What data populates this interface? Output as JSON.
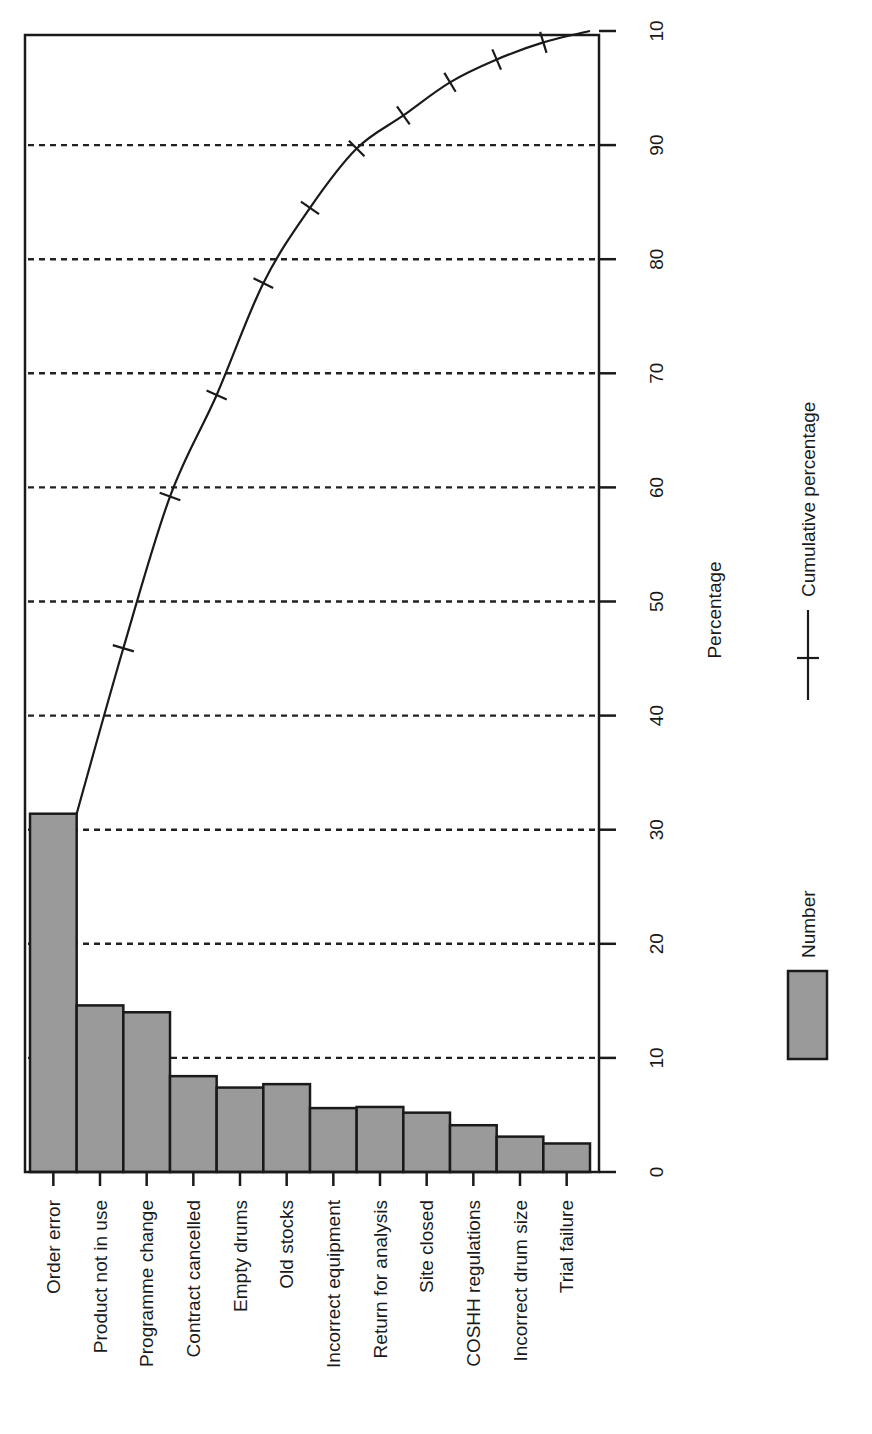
{
  "chart_data": {
    "type": "bar",
    "title": "",
    "orientation": "rotated-90-clockwise",
    "xlabel": "",
    "ylabel": "Percentage",
    "ylim": [
      0,
      100
    ],
    "yticks": [
      0,
      10,
      20,
      30,
      40,
      50,
      60,
      70,
      80,
      90,
      100
    ],
    "ytick_labels": [
      "0",
      "10",
      "20",
      "30",
      "40",
      "50",
      "60",
      "70",
      "80",
      "90",
      "10"
    ],
    "grid": "dashed horizontal lines at 10-unit intervals",
    "categories": [
      "Order error",
      "Product not in use",
      "Programme change",
      "Contract cancelled",
      "Empty drums",
      "Old stocks",
      "Incorrect equipment",
      "Return for analysis",
      "Site closed",
      "COSHH regulations",
      "Incorrect drum size",
      "Trial failure"
    ],
    "series": [
      {
        "name": "Number",
        "type": "bar",
        "values": [
          31.4,
          14.6,
          14.0,
          8.4,
          7.4,
          7.7,
          5.6,
          5.7,
          5.2,
          4.1,
          3.1,
          2.5
        ]
      },
      {
        "name": "Cumulative percentage",
        "type": "line",
        "values": [
          31.4,
          45.9,
          59.2,
          68.1,
          77.9,
          84.5,
          89.7,
          92.6,
          95.5,
          97.5,
          99.0,
          100.0
        ]
      }
    ],
    "legend": {
      "placement": "right",
      "entries": [
        {
          "label": "Number",
          "symbol": "grey-box"
        },
        {
          "label": "Cumulative percentage",
          "symbol": "line-with-cross-marker"
        }
      ]
    },
    "colors": {
      "bar_fill": "#9a9a9a",
      "ink": "#1a1a1a"
    }
  }
}
